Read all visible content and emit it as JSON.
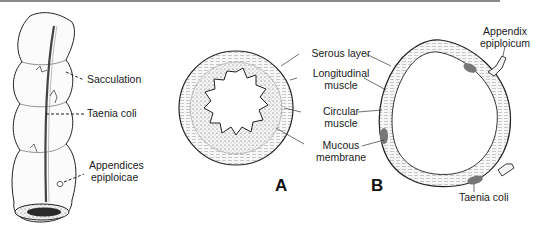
{
  "figure": {
    "colon_view": {
      "labels": {
        "sacculation": "Sacculation",
        "taenia_coli": "Taenia coli",
        "appendices_line1": "Appendices",
        "appendices_line2": "epiploicae"
      }
    },
    "cross_sections": {
      "labels": {
        "serous_layer": "Serous layer",
        "longitudinal_line1": "Longitudinal",
        "longitudinal_line2": "muscle",
        "circular_line1": "Circular",
        "circular_line2": "muscle",
        "mucous_line1": "Mucous",
        "mucous_line2": "membrane",
        "appendix_line1": "Appendix",
        "appendix_line2": "epiploicum",
        "taenia_coli_b": "Taenia coli"
      },
      "panel_a": "A",
      "panel_b": "B"
    }
  }
}
